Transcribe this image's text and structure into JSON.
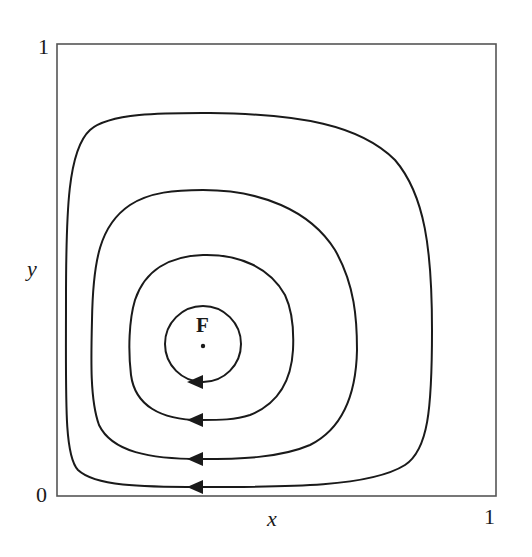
{
  "figure": {
    "type": "phase-portrait",
    "axes": {
      "x_label": "x",
      "y_label": "y",
      "x_min_tick": "0",
      "x_max_tick": "1",
      "y_min_tick": "0",
      "y_max_tick": "1"
    },
    "fixed_point": {
      "label": "F"
    },
    "orbits": [
      {
        "name": "orbit-1",
        "direction": "clockwise",
        "arrow": "left-at-bottom"
      },
      {
        "name": "orbit-2",
        "direction": "clockwise",
        "arrow": "left-at-bottom"
      },
      {
        "name": "orbit-3",
        "direction": "clockwise",
        "arrow": "left-at-bottom"
      },
      {
        "name": "orbit-4",
        "direction": "clockwise",
        "arrow": "left-at-bottom"
      }
    ],
    "colors": {
      "stroke": "#1a1a1a",
      "frame": "#555555",
      "background": "#ffffff"
    }
  }
}
